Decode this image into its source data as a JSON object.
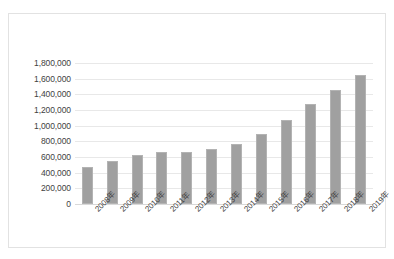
{
  "chart_data": {
    "type": "bar",
    "title": "",
    "subtitle": "",
    "xlabel": "",
    "ylabel": "",
    "categories": [
      "2008年",
      "2009年",
      "2010年",
      "2011年",
      "2012年",
      "2013年",
      "2014年",
      "2015年",
      "2016年",
      "2017年",
      "2018年",
      "2019年"
    ],
    "values": [
      475000,
      545000,
      632000,
      670000,
      660000,
      700000,
      770000,
      900000,
      1070000,
      1280000,
      1455000,
      1650000
    ],
    "series": [
      {
        "name": "",
        "values": [
          475000,
          545000,
          632000,
          670000,
          660000,
          700000,
          770000,
          900000,
          1070000,
          1280000,
          1455000,
          1650000
        ]
      }
    ],
    "ylim": [
      0,
      1800000
    ],
    "ytick_step": 200000,
    "ytick_labels": [
      "1,800,000",
      "1,600,000",
      "1,400,000",
      "1,200,000",
      "1,000,000",
      "800,000",
      "600,000",
      "400,000",
      "200,000",
      "0"
    ],
    "ytick_values": [
      1800000,
      1600000,
      1400000,
      1200000,
      1000000,
      800000,
      600000,
      400000,
      200000,
      0
    ],
    "grid": true,
    "legend": false,
    "legend_position": "none",
    "bar_color": "#a0a0a0",
    "gridline_color": "#e8e8e8",
    "axis_text_color": "#3f3f3f",
    "plot_background": "#ffffff",
    "frame_color": "#e2e2e2",
    "xtick_rotation": -45
  }
}
